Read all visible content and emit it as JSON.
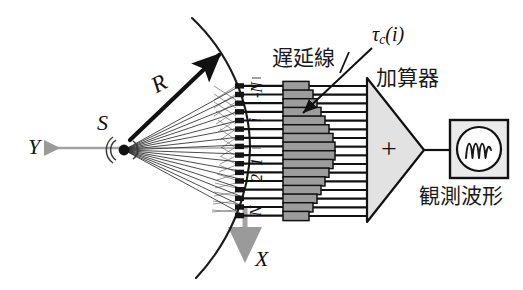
{
  "figure": {
    "background_color": "#ffffff",
    "ink_color": "#111111",
    "gray_axis_color": "#9a9a9a",
    "delay_block_fill": "#9c9c9c",
    "adder_fill": "#e0e0e0",
    "scope_fill": "#e8e8e8"
  },
  "labels": {
    "y_axis": "Y",
    "x_axis": "X",
    "source": "S",
    "radius": "R",
    "delay_line_jp": "遅延線",
    "tau_symbol": "τ",
    "tau_subscript": "c",
    "tau_argument": "(i)",
    "adder_jp": "加算器",
    "adder_sign": "+",
    "observed_waveform_jp": "観測波形"
  },
  "array": {
    "element_count": 16,
    "index_labels": [
      {
        "text": "-N",
        "position": "top"
      },
      {
        "text": "i",
        "position": "upper"
      },
      {
        "text": "1",
        "position": "center-upper"
      },
      {
        "text": "2",
        "position": "center-lower"
      },
      {
        "text": "N",
        "position": "bottom"
      }
    ],
    "top_y": 86,
    "bottom_y": 216,
    "x": 240
  },
  "delay_line": {
    "channel_count": 16,
    "block_widths": [
      26,
      30,
      34,
      38,
      42,
      46,
      50,
      52,
      52,
      50,
      46,
      42,
      38,
      34,
      30,
      26
    ]
  },
  "chart_data": {
    "type": "diagram",
    "axes": {
      "horizontal": "Y",
      "vertical": "X"
    },
    "signal_path": [
      "source S",
      "wavefront arc R",
      "array elements",
      "delay line",
      "adder",
      "oscilloscope"
    ]
  }
}
